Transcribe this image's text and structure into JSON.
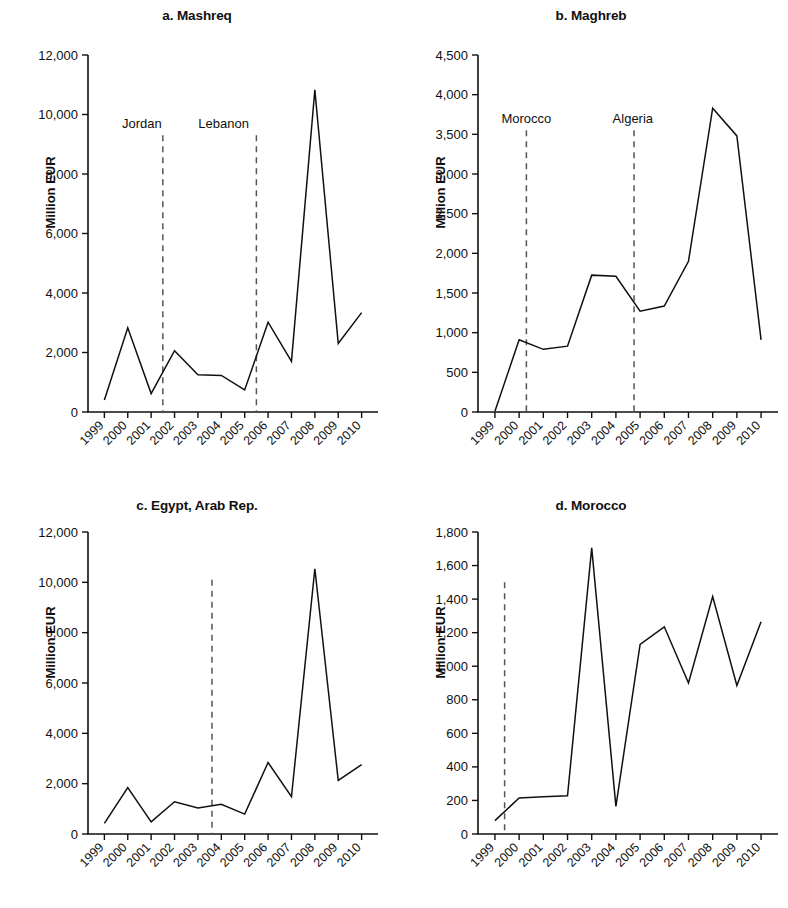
{
  "figure": {
    "ylabel": "Million EUR",
    "years": [
      "1999",
      "2000",
      "2001",
      "2002",
      "2003",
      "2004",
      "2005",
      "2006",
      "2007",
      "2008",
      "2009",
      "2010"
    ]
  },
  "chart_data": [
    {
      "type": "line",
      "panel": "a",
      "title": "a. Mashreq",
      "xlabel": "",
      "ylabel": "Million EUR",
      "x": [
        "1999",
        "2000",
        "2001",
        "2002",
        "2003",
        "2004",
        "2005",
        "2006",
        "2007",
        "2008",
        "2009",
        "2010"
      ],
      "values": [
        400,
        2830,
        620,
        2060,
        1250,
        1230,
        740,
        3020,
        1700,
        10830,
        2300,
        3340
      ],
      "ylim": [
        0,
        12000
      ],
      "yticks": [
        "0",
        "2,000",
        "4,000",
        "6,000",
        "8,000",
        "10,000",
        "12,000"
      ],
      "ytick_values": [
        0,
        2000,
        4000,
        6000,
        8000,
        10000,
        12000
      ],
      "grid": false,
      "legend": "none",
      "annotations": [
        {
          "label": "Jordan",
          "at_year": "2002",
          "offset": -0.5,
          "label_x": "2000.6"
        },
        {
          "label": "Lebanon",
          "at_year": "2006",
          "offset": -0.5,
          "label_x": "2004.1"
        }
      ]
    },
    {
      "type": "line",
      "panel": "b",
      "title": "b. Maghreb",
      "xlabel": "",
      "ylabel": "Million EUR",
      "x": [
        "1999",
        "2000",
        "2001",
        "2002",
        "2003",
        "2004",
        "2005",
        "2006",
        "2007",
        "2008",
        "2009",
        "2010"
      ],
      "values": [
        10,
        910,
        790,
        830,
        1725,
        1710,
        1270,
        1335,
        1900,
        3830,
        3480,
        910
      ],
      "ylim": [
        0,
        4500
      ],
      "yticks": [
        "0",
        "500",
        "1,000",
        "1,500",
        "2,000",
        "2,500",
        "3,000",
        "3,500",
        "4,000",
        "4,500"
      ],
      "ytick_values": [
        0,
        500,
        1000,
        1500,
        2000,
        2500,
        3000,
        3500,
        4000,
        4500
      ],
      "grid": false,
      "legend": "none",
      "annotations": [
        {
          "label": "Morocco",
          "at_year": "2000",
          "offset": 0.3,
          "label_x": "2000.3"
        },
        {
          "label": "Algeria",
          "at_year": "2004",
          "offset": 0.75,
          "label_x": "2004.7"
        }
      ]
    },
    {
      "type": "line",
      "panel": "c",
      "title": "c. Egypt, Arab Rep.",
      "xlabel": "",
      "ylabel": "Million EUR",
      "x": [
        "1999",
        "2000",
        "2001",
        "2002",
        "2003",
        "2004",
        "2005",
        "2006",
        "2007",
        "2008",
        "2009",
        "2010"
      ],
      "values": [
        420,
        1840,
        480,
        1280,
        1030,
        1180,
        790,
        2840,
        1480,
        10540,
        2130,
        2760
      ],
      "ylim": [
        0,
        12000
      ],
      "yticks": [
        "0",
        "2,000",
        "4,000",
        "6,000",
        "8,000",
        "10,000",
        "12,000"
      ],
      "ytick_values": [
        0,
        2000,
        4000,
        6000,
        8000,
        10000,
        12000
      ],
      "grid": false,
      "legend": "none",
      "annotations": [
        {
          "label": "",
          "at_year": "2004",
          "offset": -0.4,
          "label_x": ""
        }
      ]
    },
    {
      "type": "line",
      "panel": "d",
      "title": "d. Morocco",
      "xlabel": "",
      "ylabel": "Million EUR",
      "x": [
        "1999",
        "2000",
        "2001",
        "2002",
        "2003",
        "2004",
        "2005",
        "2006",
        "2007",
        "2008",
        "2009",
        "2010"
      ],
      "values": [
        80,
        215,
        222,
        228,
        1705,
        165,
        1130,
        1235,
        900,
        1415,
        885,
        1265
      ],
      "ylim": [
        0,
        1800
      ],
      "yticks": [
        "0",
        "200",
        "400",
        "600",
        "800",
        "1,000",
        "1,200",
        "1,400",
        "1,600",
        "1,800"
      ],
      "ytick_values": [
        0,
        200,
        400,
        600,
        800,
        1000,
        1200,
        1400,
        1600,
        1800
      ],
      "grid": false,
      "legend": "none",
      "annotations": [
        {
          "label": "",
          "at_year": "2000",
          "offset": -0.6,
          "label_x": ""
        }
      ]
    }
  ]
}
